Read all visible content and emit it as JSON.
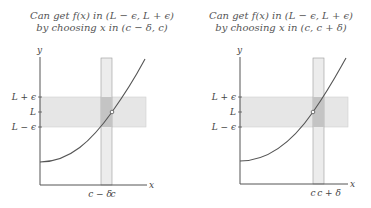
{
  "left_panel": {
    "caption_line1": "Can get f(x) in (L − ϵ, L + ϵ)",
    "caption_line2": "by choosing x in (c − δ, c)",
    "y_axis_label": "y",
    "x_axis_label": "x",
    "y_ticks": [
      "L + ϵ",
      "L",
      "L − ϵ"
    ],
    "x_ticks": [
      "c − δ",
      "c"
    ]
  },
  "right_panel": {
    "caption_line1": "Can get f(x) in (L − ϵ, L + ϵ)",
    "caption_line2": "by choosing x in (c, c + δ)",
    "y_axis_label": "y",
    "x_axis_label": "x",
    "y_ticks": [
      "L + ϵ",
      "L",
      "L − ϵ"
    ],
    "x_ticks": [
      "c",
      "c + δ"
    ]
  },
  "colors": {
    "band": "#e6e6e6",
    "overlap": "#c4c4c4",
    "axis": "#555555",
    "curve": "#555555",
    "guide": "#888888"
  }
}
